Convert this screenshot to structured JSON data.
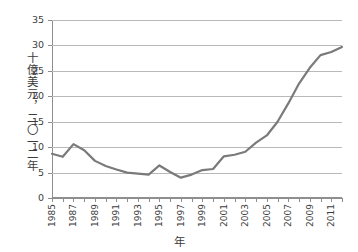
{
  "chart_data": {
    "type": "line",
    "title": "",
    "subtitle": "",
    "xlabel": "年",
    "ylabel": "十億美元，二〇一二年",
    "xlim": [
      1985,
      2012
    ],
    "ylim": [
      0,
      35
    ],
    "yticks": [
      0,
      5,
      10,
      15,
      20,
      25,
      30,
      35
    ],
    "ytick_labels": [
      "0",
      "5",
      "10",
      "15",
      "20",
      "25",
      "30",
      "35"
    ],
    "xticks": [
      1985,
      1986,
      1987,
      1988,
      1989,
      1990,
      1991,
      1992,
      1993,
      1994,
      1995,
      1996,
      1997,
      1998,
      1999,
      2000,
      2001,
      2002,
      2003,
      2004,
      2005,
      2006,
      2007,
      2008,
      2009,
      2010,
      2011,
      2012
    ],
    "xtick_labels_shown": [
      "1985",
      "1987",
      "1989",
      "1991",
      "1993",
      "1995",
      "1997",
      "1999",
      "2001",
      "2003",
      "2005",
      "2007",
      "2009",
      "2011"
    ],
    "xtick_label_step": 2,
    "grid": "horizontal",
    "legend": "none",
    "line_color": "#7a7a7a",
    "line_width": 2.2,
    "axis_color": "#8e8e8e",
    "grid_color": "#b9b9b9",
    "background": "#ffffff",
    "x": [
      1985,
      1986,
      1987,
      1988,
      1989,
      1990,
      1991,
      1992,
      1993,
      1994,
      1995,
      1996,
      1997,
      1998,
      1999,
      2000,
      2001,
      2002,
      2003,
      2004,
      2005,
      2006,
      2007,
      2008,
      2009,
      2010,
      2011,
      2012
    ],
    "values": [
      8.7,
      8.1,
      10.6,
      9.4,
      7.3,
      6.3,
      5.6,
      5.0,
      4.8,
      4.6,
      6.4,
      5.1,
      4.0,
      4.6,
      5.5,
      5.7,
      8.2,
      8.5,
      9.1,
      10.9,
      12.3,
      15.0,
      18.6,
      22.5,
      25.6,
      28.1,
      28.7,
      29.7
    ],
    "series": [
      {
        "name": "",
        "values": [
          8.7,
          8.1,
          10.6,
          9.4,
          7.3,
          6.3,
          5.6,
          5.0,
          4.8,
          4.6,
          6.4,
          5.1,
          4.0,
          4.6,
          5.5,
          5.7,
          8.2,
          8.5,
          9.1,
          10.9,
          12.3,
          15.0,
          18.6,
          22.5,
          25.6,
          28.1,
          28.7,
          29.7
        ]
      }
    ],
    "notes": {
      "peak_value": 31.3,
      "peak_year": 2011,
      "min_value": 4.0,
      "min_year": 1997,
      "end_value": 29.3,
      "end_year": 2012
    }
  }
}
